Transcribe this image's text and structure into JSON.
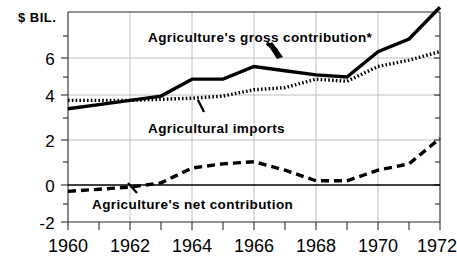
{
  "chart_data": {
    "type": "line",
    "title": "",
    "subtitle": "",
    "ylabel": "$ BIL.",
    "xlabel": "",
    "x": [
      1960,
      1961,
      1962,
      1963,
      1964,
      1965,
      1966,
      1967,
      1968,
      1969,
      1970,
      1971,
      1972
    ],
    "xlim": [
      1960,
      1972.6
    ],
    "ylim": [
      -2,
      8.6
    ],
    "yticks": [
      -2,
      0,
      2,
      4,
      6
    ],
    "ytick_labels": [
      "-2",
      "0",
      "2",
      "4",
      "6"
    ],
    "xticks": [
      1960,
      1961,
      1962,
      1963,
      1964,
      1965,
      1966,
      1967,
      1968,
      1969,
      1970,
      1971,
      1972
    ],
    "xtick_labels": [
      "1960",
      "",
      "1962",
      "",
      "1964",
      "",
      "1966",
      "",
      "1968",
      "",
      "1970",
      "",
      "1972"
    ],
    "xtick_labels_shown": [
      "1960",
      "1962",
      "1964",
      "1966",
      "1968",
      "1970",
      "1972"
    ],
    "grid": true,
    "grid_axis": "both",
    "legend": "annotations",
    "zero_line": true,
    "series": [
      {
        "name": "Agriculture's gross contribution*",
        "style": "solid",
        "color": "#000000",
        "values": [
          3.6,
          3.8,
          4.0,
          4.2,
          5.0,
          5.0,
          5.6,
          5.4,
          5.2,
          5.1,
          6.3,
          6.9,
          8.4
        ]
      },
      {
        "name": "Agricultural imports",
        "style": "dotted",
        "color": "#000000",
        "values": [
          4.0,
          4.0,
          4.0,
          4.05,
          4.1,
          4.2,
          4.5,
          4.6,
          5.0,
          4.9,
          5.6,
          5.9,
          6.3
        ]
      },
      {
        "name": "Agriculture's net contribution",
        "style": "dashed",
        "color": "#000000",
        "values": [
          -0.3,
          -0.2,
          -0.1,
          0.1,
          0.8,
          1.0,
          1.1,
          0.7,
          0.2,
          0.2,
          0.7,
          1.0,
          2.2
        ]
      }
    ],
    "annotations": [
      {
        "id": "gross-annotation",
        "text": "Agriculture's gross contribution*",
        "x": 1966.3,
        "y": 7.3
      },
      {
        "id": "imports-annotation",
        "text": "Agricultural imports",
        "x": 1964.5,
        "y": 3.05
      },
      {
        "id": "net-annotation",
        "text": "Agriculture's net contribution",
        "x": 1962.7,
        "y": -1.05
      }
    ]
  },
  "axis": {
    "y_title": "$ BIL."
  }
}
